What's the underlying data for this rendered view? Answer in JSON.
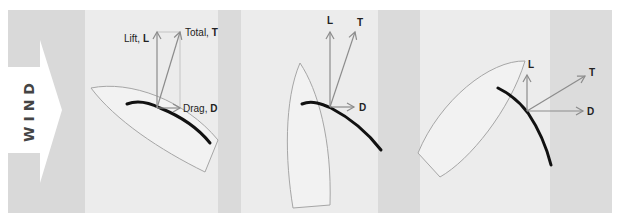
{
  "colors": {
    "page_bg": "#ffffff",
    "band_dark": "#d9d9d9",
    "band_light": "#ececec",
    "wind_arrow": "#ffffff",
    "hull_stroke": "#a6a6a6",
    "hull_fill": "#f2f2f2",
    "sail": "#111111",
    "vector": "#8c8c8c",
    "label": "#222222"
  },
  "wind": {
    "label": "WIND"
  },
  "panels": [
    {
      "id": "panel-1",
      "lift_label_prefix": "Lift, ",
      "lift_label_symbol": "L",
      "total_label_prefix": "Total, ",
      "total_label_symbol": "T",
      "drag_label_prefix": "Drag, ",
      "drag_label_symbol": "D"
    },
    {
      "id": "panel-2",
      "lift_label_symbol": "L",
      "total_label_symbol": "T",
      "drag_label_symbol": "D"
    },
    {
      "id": "panel-3",
      "lift_label_symbol": "L",
      "total_label_symbol": "T",
      "drag_label_symbol": "D"
    }
  ]
}
